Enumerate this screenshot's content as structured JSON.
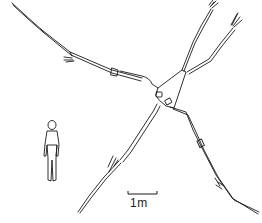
{
  "figure": {
    "scale_bar": {
      "label": "1m"
    }
  }
}
